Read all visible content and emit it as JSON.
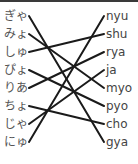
{
  "exercise": {
    "type": "matching",
    "left": [
      "ぎゃ",
      "みょ",
      "しゅ",
      "ぴょ",
      "りあ",
      "ちょ",
      "じゃ",
      "にゅ"
    ],
    "right": [
      "nyu",
      "shu",
      "rya",
      "ja",
      "myo",
      "pyo",
      "cho",
      "gya"
    ],
    "connections": [
      {
        "from": 0,
        "to": 7
      },
      {
        "from": 1,
        "to": 4
      },
      {
        "from": 2,
        "to": 1
      },
      {
        "from": 3,
        "to": 5
      },
      {
        "from": 4,
        "to": 2
      },
      {
        "from": 5,
        "to": 6
      },
      {
        "from": 6,
        "to": 3
      },
      {
        "from": 7,
        "to": 0
      }
    ],
    "line_color": "#1a1a1a"
  }
}
